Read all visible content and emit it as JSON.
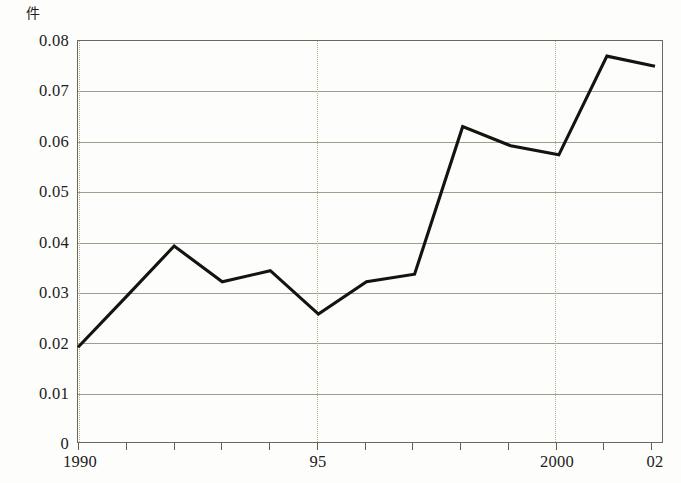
{
  "chart_data": {
    "type": "line",
    "title": "",
    "subtitle": "",
    "xlabel": "",
    "ylabel": "件",
    "unit_label": "件",
    "x": [
      1990,
      1991,
      1992,
      1993,
      1994,
      1995,
      1996,
      1997,
      1998,
      1999,
      2000,
      2001,
      2002
    ],
    "values": [
      0.019,
      0.029,
      0.0391,
      0.032,
      0.0342,
      0.0256,
      0.032,
      0.0335,
      0.0628,
      0.059,
      0.0572,
      0.0768,
      0.0748
    ],
    "series": [
      {
        "name": "",
        "values": [
          0.019,
          0.029,
          0.0391,
          0.032,
          0.0342,
          0.0256,
          0.032,
          0.0335,
          0.0628,
          0.059,
          0.0572,
          0.0768,
          0.0748
        ]
      }
    ],
    "ylim": [
      0,
      0.08
    ],
    "xlim": [
      1990,
      2002
    ],
    "yticks": [
      0,
      0.01,
      0.02,
      0.03,
      0.04,
      0.05,
      0.06,
      0.07,
      0.08
    ],
    "ytick_labels": [
      "0",
      "0.01",
      "0.02",
      "0.03",
      "0.04",
      "0.05",
      "0.06",
      "0.07",
      "0.08"
    ],
    "xtick_values": [
      1990,
      1991,
      1992,
      1993,
      1994,
      1995,
      1996,
      1997,
      1998,
      1999,
      2000,
      2001,
      2002
    ],
    "xtick_labels": [
      "1990",
      "",
      "",
      "",
      "",
      "95",
      "",
      "",
      "",
      "",
      "2000",
      "",
      "02"
    ],
    "grid": true,
    "grid_axis": "y",
    "legend": "none",
    "vertical_guides": [
      1990,
      1995,
      2000
    ],
    "colors": {
      "line": "#151310",
      "grid": "#8d8d78",
      "frame": "#6a6a5a",
      "guide": "#b9ae8c",
      "background": "#fdfdfb",
      "text": "#22201c"
    }
  }
}
